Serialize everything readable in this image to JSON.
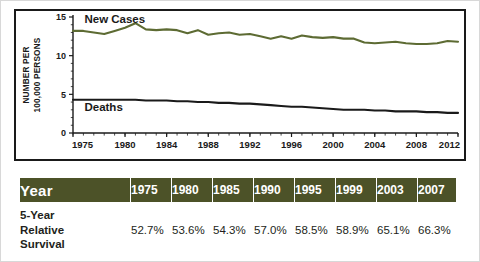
{
  "chart_data": {
    "type": "line",
    "title": "",
    "xlabel": "",
    "ylabel": "NUMBER PER 100,000 PERSONS",
    "xlim": [
      1975,
      2012
    ],
    "ylim": [
      0,
      15
    ],
    "yticks": [
      0,
      5,
      10,
      15
    ],
    "ytick_labels": [
      "0",
      "5",
      "10",
      "15"
    ],
    "xticks": [
      1975,
      1980,
      1984,
      1988,
      1992,
      1996,
      2000,
      2004,
      2008,
      2012
    ],
    "xtick_labels": [
      "1975",
      "1980",
      "1984",
      "1988",
      "1992",
      "1996",
      "2000",
      "2004",
      "2008",
      "2012"
    ],
    "grid": false,
    "legend_position": "inline-annotations",
    "x": [
      1975,
      1976,
      1977,
      1978,
      1979,
      1980,
      1981,
      1982,
      1983,
      1984,
      1985,
      1986,
      1987,
      1988,
      1989,
      1990,
      1991,
      1992,
      1993,
      1994,
      1995,
      1996,
      1997,
      1998,
      1999,
      2000,
      2001,
      2002,
      2003,
      2004,
      2005,
      2006,
      2007,
      2008,
      2009,
      2010,
      2011,
      2012
    ],
    "series": [
      {
        "name": "New Cases",
        "color": "#5d6b33",
        "values": [
          13.2,
          13.2,
          13.0,
          12.8,
          13.2,
          13.6,
          14.2,
          13.4,
          13.3,
          13.4,
          13.3,
          12.9,
          13.3,
          12.7,
          12.9,
          13.0,
          12.7,
          12.8,
          12.5,
          12.2,
          12.5,
          12.2,
          12.6,
          12.4,
          12.3,
          12.4,
          12.2,
          12.2,
          11.7,
          11.6,
          11.7,
          11.8,
          11.6,
          11.5,
          11.5,
          11.6,
          11.9,
          11.8
        ]
      },
      {
        "name": "Deaths",
        "color": "#1a1a1a",
        "values": [
          4.3,
          4.3,
          4.3,
          4.3,
          4.3,
          4.3,
          4.3,
          4.2,
          4.2,
          4.2,
          4.1,
          4.1,
          4.0,
          4.0,
          3.9,
          3.9,
          3.8,
          3.8,
          3.7,
          3.6,
          3.5,
          3.4,
          3.4,
          3.3,
          3.2,
          3.1,
          3.0,
          3.0,
          3.0,
          2.9,
          2.9,
          2.8,
          2.8,
          2.8,
          2.7,
          2.7,
          2.6,
          2.6
        ]
      }
    ],
    "annotations": [
      {
        "text": "New Cases",
        "x": 1976.1,
        "y": 14.7
      },
      {
        "text": "Deaths",
        "x": 1976.1,
        "y": 3.3
      }
    ]
  },
  "table": {
    "columns": [
      "Year",
      "1975",
      "1980",
      "1985",
      "1990",
      "1995",
      "1999",
      "2003",
      "2007"
    ],
    "rows": [
      {
        "label": "5-Year\nRelative\nSurvival",
        "label_lines": [
          "5-Year",
          "Relative",
          "Survival"
        ],
        "values": [
          "52.7%",
          "53.6%",
          "54.3%",
          "57.0%",
          "58.5%",
          "58.9%",
          "65.1%",
          "66.3%"
        ]
      }
    ]
  },
  "colors": {
    "new_cases_line": "#5d6b33",
    "deaths_line": "#1a1a1a",
    "table_header_bg": "#4c5228",
    "table_header_text": "#ffffff",
    "panel_border": "#1a1a1a",
    "figure_border": "#d8d8d8"
  }
}
